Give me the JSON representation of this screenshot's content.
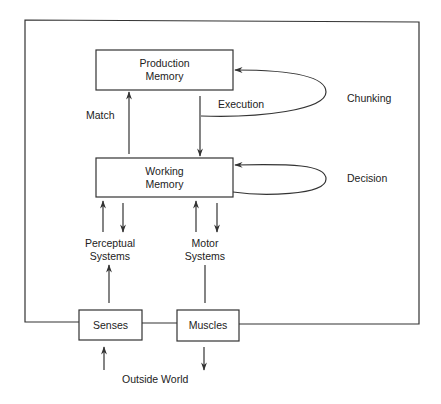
{
  "diagram": {
    "boxes": {
      "production_memory": {
        "line1": "Production",
        "line2": "Memory"
      },
      "working_memory": {
        "line1": "Working",
        "line2": "Memory"
      },
      "senses": {
        "label": "Senses"
      },
      "muscles": {
        "label": "Muscles"
      }
    },
    "edge_labels": {
      "match": "Match",
      "execution": "Execution",
      "chunking": "Chunking",
      "decision": "Decision",
      "perceptual_line1": "Perceptual",
      "perceptual_line2": "Systems",
      "motor_line1": "Motor",
      "motor_line2": "Systems",
      "outside_world": "Outside World"
    },
    "colors": {
      "line": "#333333",
      "background": "#ffffff",
      "text": "#222222"
    }
  }
}
